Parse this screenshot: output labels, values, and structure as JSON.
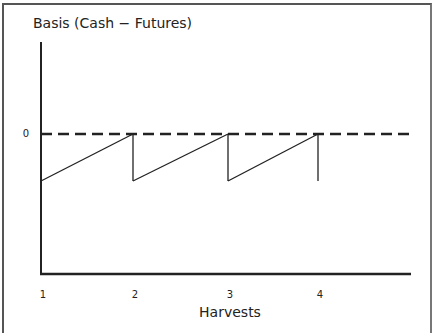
{
  "chart_data": {
    "type": "line",
    "title": "Basis (Cash − Futures)",
    "xlabel": "Harvests",
    "ylabel": "Basis (Cash − Futures)",
    "x_ticks": [
      "1",
      "2",
      "3",
      "4"
    ],
    "x_tick_values": [
      1,
      2,
      3,
      4
    ],
    "y_ticks": [
      "0"
    ],
    "y_tick_values": [
      0
    ],
    "xlim": [
      1,
      5
    ],
    "ylim": [
      -3,
      1
    ],
    "grid": false,
    "reference_line": {
      "y": 0,
      "style": "dashed",
      "extends_to_x": 5
    },
    "series": [
      {
        "name": "Basis",
        "points": [
          {
            "x": 1,
            "y": -1
          },
          {
            "x": 2,
            "y": 0
          },
          {
            "x": 2,
            "y": -1
          },
          {
            "x": 3,
            "y": 0
          },
          {
            "x": 3,
            "y": -1
          },
          {
            "x": 4,
            "y": 0
          },
          {
            "x": 4,
            "y": -1
          }
        ]
      }
    ]
  }
}
